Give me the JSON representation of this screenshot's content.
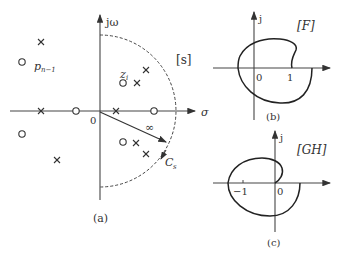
{
  "panel_a": {
    "caption": "(a)",
    "plane_label": "[s]",
    "imag_axis_label": "jω",
    "real_axis_label": "σ",
    "origin_label": "0",
    "pole_label_main": "p",
    "pole_label_sub": "n−1",
    "zero_label_main": "z",
    "zero_label_sub": "i",
    "infinity_label": "∞",
    "contour_label_main": "C",
    "contour_label_sub": "s",
    "poles": [
      [
        41,
        42
      ],
      [
        41,
        111
      ],
      [
        116,
        111
      ],
      [
        137,
        83
      ],
      [
        146,
        70
      ],
      [
        57,
        160
      ],
      [
        136,
        143
      ],
      [
        146,
        154
      ]
    ],
    "zeros": [
      [
        22,
        62
      ],
      [
        76,
        111
      ],
      [
        154,
        111
      ],
      [
        123,
        83
      ],
      [
        22,
        134
      ],
      [
        123,
        142
      ]
    ]
  },
  "panel_b": {
    "caption": "(b)",
    "plane_label": "[F]",
    "imag_axis_label": "j",
    "origin_label": "0",
    "tick_label": "1"
  },
  "panel_c": {
    "caption": "(c)",
    "plane_label": "[GH]",
    "imag_axis_label": "j",
    "origin_label": "0",
    "tick_label": "−1"
  }
}
